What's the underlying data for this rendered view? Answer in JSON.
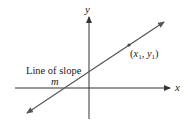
{
  "diagram": {
    "axes": {
      "x_label": "x",
      "y_label": "y"
    },
    "line": {
      "label_line1": "Line of slope",
      "label_line2": "m"
    },
    "point": {
      "label_open": "(",
      "label_x": "x",
      "label_x_sub": "1",
      "label_sep": ", ",
      "label_y": "y",
      "label_y_sub": "1",
      "label_close": ")"
    },
    "colors": {
      "axis": "#333333",
      "line": "#555555",
      "text": "#222222"
    }
  }
}
